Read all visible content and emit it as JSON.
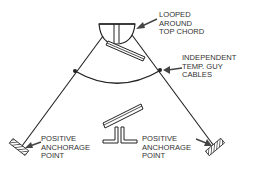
{
  "labels": {
    "looped": [
      "LOOPED",
      "AROUND",
      "TOP CHORD"
    ],
    "guy_cables": [
      "INDEPENDENT",
      "TEMP. GUY",
      "CABLES"
    ],
    "anchor_left": [
      "POSITIVE",
      "ANCHORAGE",
      "POINT"
    ],
    "anchor_right": [
      "POSITIVE",
      "ANCHORAGE",
      "POINT"
    ]
  },
  "colors": {
    "line": "#222222",
    "text": "#333333",
    "arrow": "#444444",
    "background": "#ffffff"
  }
}
